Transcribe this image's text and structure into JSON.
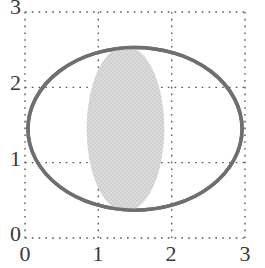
{
  "chart_data": {
    "type": "scatter",
    "title": "",
    "xlabel": "",
    "ylabel": "",
    "xlim": [
      0,
      3
    ],
    "ylim": [
      0,
      3
    ],
    "xticks": [
      0,
      1,
      2,
      3
    ],
    "yticks": [
      0,
      1,
      2,
      3
    ],
    "xtick_labels": [
      "0",
      "1",
      "2",
      "3"
    ],
    "ytick_labels": [
      "0",
      "1",
      "2",
      "3"
    ],
    "grid": true,
    "grid_style": "dotted",
    "grid_color": "#555555",
    "legend": false,
    "aspect": "equal",
    "background": "#ffffff",
    "shapes": [
      {
        "name": "outer-ellipse",
        "type": "ellipse",
        "center_x": 1.5,
        "center_y": 1.45,
        "semi_axis_x": 1.46,
        "semi_axis_y": 1.08,
        "rotation_deg": 0,
        "fill": "none",
        "stroke": "#6f6f6f",
        "stroke_width": 3.5
      },
      {
        "name": "inner-ellipse",
        "type": "ellipse",
        "center_x": 1.37,
        "center_y": 1.45,
        "semi_axis_x": 0.53,
        "semi_axis_y": 1.1,
        "rotation_deg": 0,
        "fill": "#d6d6d6",
        "stroke": "none",
        "stroke_width": 0
      }
    ]
  },
  "axes": {
    "x": {
      "ticks": [
        {
          "value": "0"
        },
        {
          "value": "1"
        },
        {
          "value": "2"
        },
        {
          "value": "3"
        }
      ]
    },
    "y": {
      "ticks": [
        {
          "value": "0"
        },
        {
          "value": "1"
        },
        {
          "value": "2"
        },
        {
          "value": "3"
        }
      ]
    }
  },
  "colors": {
    "outline": "#6f6f6f",
    "fill": "#d6d6d6",
    "grid": "#555555",
    "text": "#3a3a3a",
    "background": "#ffffff"
  }
}
